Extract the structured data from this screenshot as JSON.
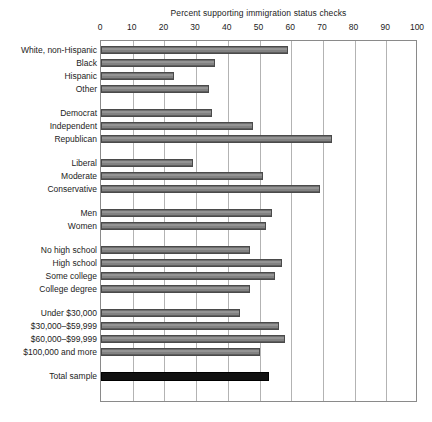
{
  "chart_data": {
    "type": "bar",
    "orientation": "horizontal",
    "title": "Percent supporting immigration status checks",
    "xlabel": "",
    "ylabel": "",
    "xlim": [
      0,
      100
    ],
    "xticks": [
      0,
      10,
      20,
      30,
      40,
      50,
      60,
      70,
      80,
      90,
      100
    ],
    "xtick_labels": [
      "0",
      "10",
      "20",
      "30",
      "40",
      "50",
      "60",
      "70",
      "80",
      "90",
      "100"
    ],
    "grid": true,
    "legend": "none",
    "categories": [
      "White, non-Hispanic",
      "Black",
      "Hispanic",
      "Other",
      "Democrat",
      "Independent",
      "Republican",
      "Liberal",
      "Moderate",
      "Conservative",
      "Men",
      "Women",
      "No high school",
      "High school",
      "Some college",
      "College degree",
      "Under $30,000",
      "$30,000–$59,999",
      "$60,000–$99,999",
      "$100,000 and more",
      "Total sample"
    ],
    "values": [
      59,
      36,
      23,
      34,
      35,
      48,
      73,
      29,
      51,
      69,
      54,
      52,
      47,
      57,
      55,
      47,
      44,
      56,
      58,
      50,
      53
    ],
    "groups": [
      {
        "name": "Race/ethnicity",
        "categories": [
          "White, non-Hispanic",
          "Black",
          "Hispanic",
          "Other"
        ]
      },
      {
        "name": "Party",
        "categories": [
          "Democrat",
          "Independent",
          "Republican"
        ]
      },
      {
        "name": "Ideology",
        "categories": [
          "Liberal",
          "Moderate",
          "Conservative"
        ]
      },
      {
        "name": "Gender",
        "categories": [
          "Men",
          "Women"
        ]
      },
      {
        "name": "Education",
        "categories": [
          "No high school",
          "High school",
          "Some college",
          "College degree"
        ]
      },
      {
        "name": "Income",
        "categories": [
          "Under $30,000",
          "$30,000–$59,999",
          "$60,000–$99,999",
          "$100,000 and more"
        ]
      },
      {
        "name": "Total",
        "categories": [
          "Total sample"
        ]
      }
    ],
    "highlight_category": "Total sample",
    "colors": {
      "bar_fill": "#8a8a8a",
      "bar_edge": "#4a4a4a",
      "total_bar_fill": "#111111",
      "gridline": "#b3b3b3",
      "axis": "#8a8a8a",
      "text": "#1c1c1c",
      "background": "#ffffff"
    }
  }
}
